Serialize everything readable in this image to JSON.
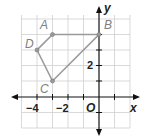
{
  "diagram": {
    "type": "coordinate-plane-polygon",
    "axes": {
      "x_label": "x",
      "y_label": "y",
      "origin_label": "O"
    },
    "x_ticks": [
      "−4",
      "−2"
    ],
    "y_ticks": [
      "2"
    ],
    "grid": {
      "x_min": -5,
      "x_max": 2,
      "y_min": -2,
      "y_max": 5
    },
    "points": [
      {
        "label": "A",
        "x": -3,
        "y": 4
      },
      {
        "label": "B",
        "x": 0,
        "y": 4
      },
      {
        "label": "C",
        "x": -3,
        "y": 1
      },
      {
        "label": "D",
        "x": -4,
        "y": 3
      }
    ],
    "polygon_order": [
      "A",
      "B",
      "C",
      "D"
    ],
    "colors": {
      "polygon": "#999999",
      "grid": "#cccccc",
      "axis": "#111111"
    }
  }
}
